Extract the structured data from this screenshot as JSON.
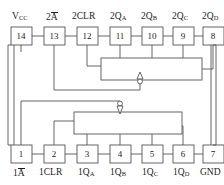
{
  "diagram": {
    "package": "14-pin DIP",
    "colors": {
      "stroke": "#555555",
      "text": "#1b1b1b",
      "background": "#ffffff",
      "pin_box_fill": "#ffffff"
    },
    "top_pins": [
      {
        "number": "14",
        "label": "V",
        "sub": "CC",
        "overbar": false,
        "prefix": ""
      },
      {
        "number": "13",
        "label": "A",
        "sub": "",
        "overbar": true,
        "prefix": "2"
      },
      {
        "number": "12",
        "label": "CLR",
        "sub": "",
        "overbar": false,
        "prefix": "2"
      },
      {
        "number": "11",
        "label": "Q",
        "sub": "A",
        "overbar": false,
        "prefix": "2"
      },
      {
        "number": "10",
        "label": "Q",
        "sub": "B",
        "overbar": false,
        "prefix": "2"
      },
      {
        "number": "9",
        "label": "Q",
        "sub": "C",
        "overbar": false,
        "prefix": "2"
      },
      {
        "number": "8",
        "label": "Q",
        "sub": "D",
        "overbar": false,
        "prefix": "2"
      }
    ],
    "bottom_pins": [
      {
        "number": "1",
        "label": "A",
        "sub": "",
        "overbar": true,
        "prefix": "1"
      },
      {
        "number": "2",
        "label": "CLR",
        "sub": "",
        "overbar": false,
        "prefix": "1"
      },
      {
        "number": "3",
        "label": "Q",
        "sub": "A",
        "overbar": false,
        "prefix": "1"
      },
      {
        "number": "4",
        "label": "Q",
        "sub": "B",
        "overbar": false,
        "prefix": "1"
      },
      {
        "number": "5",
        "label": "Q",
        "sub": "C",
        "overbar": false,
        "prefix": "1"
      },
      {
        "number": "6",
        "label": "Q",
        "sub": "D",
        "overbar": false,
        "prefix": "1"
      },
      {
        "number": "7",
        "label": "GND",
        "sub": "",
        "overbar": false,
        "prefix": ""
      }
    ],
    "top_labels_text": [
      "V_CC",
      "2Ā",
      "2CLR",
      "2Q_A",
      "2Q_B",
      "2Q_C",
      "2Q_D"
    ],
    "bottom_labels_text": [
      "1Ā",
      "1CLR",
      "1Q_A",
      "1Q_B",
      "1Q_C",
      "1Q_D",
      "GND"
    ],
    "markers": [
      {
        "name": "upper-crossover-marker",
        "direction": "up",
        "x": 140,
        "y": 78
      },
      {
        "name": "lower-crossover-marker",
        "direction": "down",
        "x": 120,
        "y": 107
      }
    ]
  }
}
